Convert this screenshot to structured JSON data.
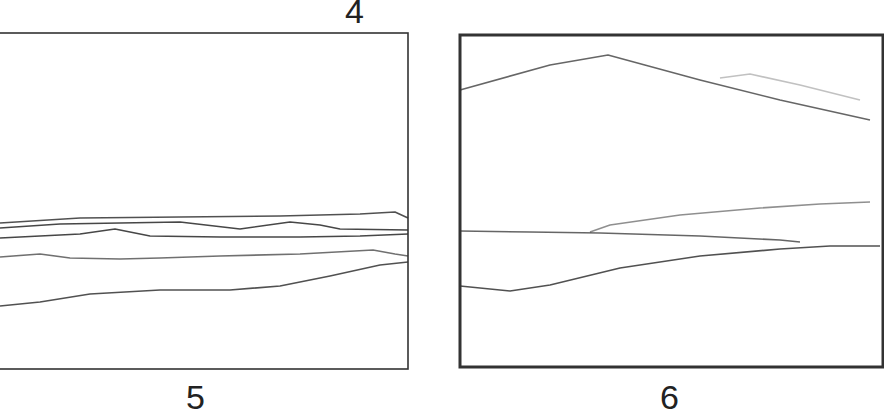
{
  "figure": {
    "top_label": "4",
    "panels": [
      {
        "id": "panel-5",
        "label": "5",
        "frame": {
          "x": -10,
          "y": 33,
          "w": 418,
          "h": 336,
          "stroke_width": 1.6
        },
        "lines": [
          {
            "name": "upper-line-1",
            "points": "0,223 80,218 180,217 280,216 360,214 395,212 408,218",
            "opacity": 0.85
          },
          {
            "name": "upper-line-2",
            "points": "0,228 60,224 180,222 240,229 290,222 320,225 340,229 408,230",
            "opacity": 0.9
          },
          {
            "name": "upper-line-3",
            "points": "0,238 80,234 115,229 150,236 220,237 300,237 360,236 408,234",
            "opacity": 0.9
          },
          {
            "name": "middle-line",
            "points": "0,257 40,254 70,258 120,259 160,258 220,256 300,254 373,250 395,254 408,256",
            "opacity": 0.7
          },
          {
            "name": "lower-line",
            "points": "0,306 40,302 90,294 160,290 230,290 280,286 330,276 380,265 408,262",
            "opacity": 0.85
          }
        ]
      },
      {
        "id": "panel-6",
        "label": "6",
        "frame": {
          "x": 460,
          "y": 35,
          "w": 423,
          "h": 332,
          "stroke_width": 3
        },
        "lines": [
          {
            "name": "peak-line",
            "points": "460,90 550,65 608,55 700,80 780,100 870,120",
            "opacity": 0.75
          },
          {
            "name": "faint-arc",
            "points": "720,78 750,74 800,85 860,100",
            "opacity": 0.3
          },
          {
            "name": "rising-line",
            "points": "590,232 610,225 680,215 760,208 820,204 870,202",
            "opacity": 0.55
          },
          {
            "name": "flat-line",
            "points": "460,231 530,232 600,233 700,236 780,240 800,242",
            "opacity": 0.75
          },
          {
            "name": "dip-rise-line",
            "points": "460,286 510,291 550,285 620,268 700,256 780,249 830,246 880,246",
            "opacity": 0.85
          }
        ]
      }
    ]
  }
}
